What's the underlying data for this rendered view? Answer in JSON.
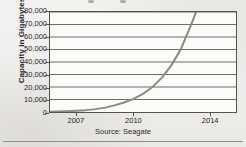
{
  "chart_data": {
    "type": "line",
    "title": "",
    "xlabel": "",
    "ylabel": "Capacity in Gigabytes",
    "source_note": "Source: Seagate",
    "grid": true,
    "legend": "none",
    "xlim": [
      2005.6,
      2015.4
    ],
    "ylim": [
      0,
      80000
    ],
    "yticks": [
      80000,
      70000,
      60000,
      50000,
      40000,
      30000,
      20000,
      10000,
      0
    ],
    "ytick_labels": [
      "80,000",
      "70,000",
      "60,000",
      "50,000",
      "40,000",
      "30,000",
      "20,000",
      "10,000",
      "0"
    ],
    "xticks": [
      2007,
      2010,
      2014
    ],
    "xtick_labels": [
      "2007",
      "2010",
      "2014"
    ],
    "series": [
      {
        "name": "Hard drive capacity",
        "color": "#8a8986",
        "x": [
          2005.6,
          2006,
          2006.5,
          2007,
          2007.5,
          2008,
          2008.5,
          2009,
          2009.5,
          2010,
          2010.5,
          2011,
          2011.5,
          2012,
          2012.5,
          2013,
          2013.3
        ],
        "values": [
          250,
          380,
          620,
          980,
          1500,
          2300,
          3500,
          5300,
          7600,
          10500,
          14500,
          20000,
          27500,
          37500,
          50500,
          68500,
          80000
        ]
      }
    ]
  },
  "axis": {
    "y_title": "Capacity in Gigabytes"
  },
  "colors": {
    "curve": "#8a8986",
    "grid": "#6e6d6a",
    "frame": "#54534f",
    "page_background": "#f2f1ef",
    "plot_background": "#fbfbfa",
    "text": "#1d1d1d"
  }
}
